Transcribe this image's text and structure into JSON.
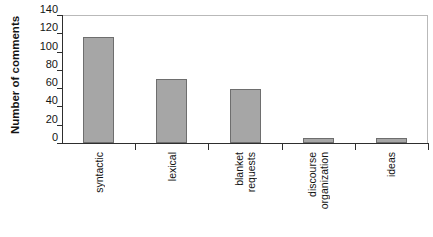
{
  "chart_data": {
    "type": "bar",
    "title": "",
    "xlabel": "",
    "ylabel": "Number of comments",
    "categories": [
      "syntactic",
      "lexical",
      "blanket requests",
      "discourse organization",
      "ideas"
    ],
    "category_lines": [
      [
        "syntactic"
      ],
      [
        "lexical"
      ],
      [
        "blanket",
        "requests"
      ],
      [
        "discourse",
        "organization"
      ],
      [
        "ideas"
      ]
    ],
    "values": [
      116,
      70,
      59,
      5,
      5
    ],
    "ylim": [
      0,
      140
    ],
    "yticks": [
      140,
      120,
      100,
      80,
      60,
      40,
      20,
      0
    ],
    "ytick_labels": [
      "140",
      "120",
      "100",
      "80",
      "60",
      "40",
      "20",
      "0"
    ],
    "grid": false,
    "legend": false,
    "bar_fill_color": "#a6a6a6",
    "bar_border_color": "#6e6e6e",
    "axis_color": "#2e2e2e",
    "frame_color": "#b9b9b9",
    "background_color": "#ffffff"
  }
}
